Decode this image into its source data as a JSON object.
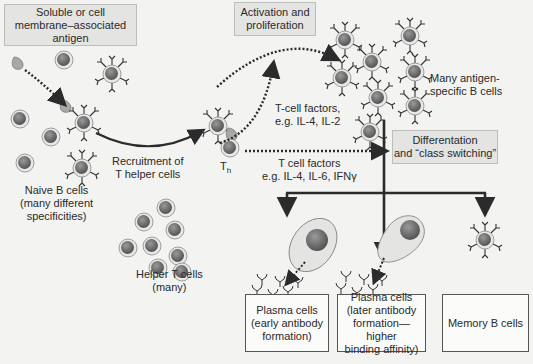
{
  "diagram": {
    "boxes": {
      "antigen": "Soluble or cell\nmembrane–associated\nantigen",
      "activation": "Activation and\nproliferation",
      "differentiation": "Differentation\nand “class switching”",
      "plasma_early": "Plasma cells\n(early antibody\nformation)",
      "plasma_late": "Plasma cells\n(later antibody\nformation—higher\nbinding affinity)",
      "memory": "Memory B cells"
    },
    "labels": {
      "naive_b": "Naive B cells\n(many different\nspecificities)",
      "recruitment": "Recruitment of\nT helper cells",
      "helper_t": "Helper T cells\n(many)",
      "th_main": "T",
      "th_sub": "h",
      "tcell_factors_1": "T-cell factors,\ne.g. IL-4, IL-2",
      "tcell_factors_2": "T cell factors\ne.g. IL-4, IL-6, IFNγ",
      "many_b": "Many antigen-\nspecific B cells"
    },
    "colors": {
      "background": "#f3f3f1",
      "cell_fill": "#d9d9d7",
      "nucleus": "#6e6e6e",
      "arrow": "#2b2b2b",
      "shade_box": "#e4e4e2"
    }
  }
}
